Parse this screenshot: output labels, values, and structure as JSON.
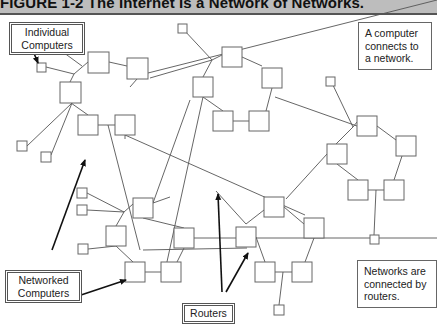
{
  "figure": {
    "title": "FIGURE 1-2   The Internet Is a Network of Networks."
  },
  "labels": {
    "individual_computers": [
      "Individual",
      "Computers"
    ],
    "networked_computers": [
      "Networked",
      "Computers"
    ],
    "routers": [
      "Routers"
    ],
    "note_top": [
      "A computer",
      "connects to",
      "a network."
    ],
    "note_bottom": [
      "Networks are",
      "connected by",
      "routers."
    ]
  },
  "colors": {
    "line": "#555555",
    "box_stroke": "#666666",
    "arrow": "#111111",
    "title_bg": "#bdbdbd"
  },
  "diagram": {
    "routers": [
      {
        "x": 88,
        "y": 52,
        "w": 21,
        "h": 21
      },
      {
        "x": 127,
        "y": 58,
        "w": 21,
        "h": 21
      },
      {
        "x": 60,
        "y": 82,
        "w": 21,
        "h": 21
      },
      {
        "x": 78,
        "y": 115,
        "w": 20,
        "h": 20
      },
      {
        "x": 115,
        "y": 115,
        "w": 20,
        "h": 20
      },
      {
        "x": 222,
        "y": 47,
        "w": 20,
        "h": 20
      },
      {
        "x": 262,
        "y": 68,
        "w": 20,
        "h": 20
      },
      {
        "x": 193,
        "y": 77,
        "w": 20,
        "h": 20
      },
      {
        "x": 213,
        "y": 111,
        "w": 20,
        "h": 20
      },
      {
        "x": 249,
        "y": 111,
        "w": 20,
        "h": 20
      },
      {
        "x": 357,
        "y": 116,
        "w": 20,
        "h": 20
      },
      {
        "x": 396,
        "y": 136,
        "w": 20,
        "h": 20
      },
      {
        "x": 327,
        "y": 144,
        "w": 20,
        "h": 20
      },
      {
        "x": 348,
        "y": 180,
        "w": 20,
        "h": 20
      },
      {
        "x": 384,
        "y": 180,
        "w": 20,
        "h": 20
      },
      {
        "x": 133,
        "y": 198,
        "w": 20,
        "h": 20
      },
      {
        "x": 106,
        "y": 226,
        "w": 20,
        "h": 20
      },
      {
        "x": 174,
        "y": 228,
        "w": 20,
        "h": 20
      },
      {
        "x": 125,
        "y": 262,
        "w": 20,
        "h": 20
      },
      {
        "x": 161,
        "y": 262,
        "w": 20,
        "h": 20
      },
      {
        "x": 264,
        "y": 197,
        "w": 20,
        "h": 20
      },
      {
        "x": 236,
        "y": 227,
        "w": 20,
        "h": 20
      },
      {
        "x": 304,
        "y": 218,
        "w": 20,
        "h": 20
      },
      {
        "x": 255,
        "y": 262,
        "w": 20,
        "h": 20
      },
      {
        "x": 292,
        "y": 262,
        "w": 20,
        "h": 20
      }
    ],
    "computers": [
      {
        "x": 46,
        "y": 42,
        "w": 10,
        "h": 10
      },
      {
        "x": 37,
        "y": 63,
        "w": 9,
        "h": 9
      },
      {
        "x": 178,
        "y": 24,
        "w": 9,
        "h": 9
      },
      {
        "x": 326,
        "y": 77,
        "w": 9,
        "h": 9
      },
      {
        "x": 17,
        "y": 141,
        "w": 10,
        "h": 10
      },
      {
        "x": 41,
        "y": 152,
        "w": 10,
        "h": 10
      },
      {
        "x": 77,
        "y": 188,
        "w": 10,
        "h": 10
      },
      {
        "x": 77,
        "y": 205,
        "w": 10,
        "h": 10
      },
      {
        "x": 78,
        "y": 244,
        "w": 10,
        "h": 10
      },
      {
        "x": 370,
        "y": 235,
        "w": 9,
        "h": 9
      },
      {
        "x": 274,
        "y": 305,
        "w": 10,
        "h": 10
      }
    ],
    "lines": [
      [
        56,
        47,
        82,
        66
      ],
      [
        46,
        67,
        74,
        74
      ],
      [
        74,
        74,
        88,
        62
      ],
      [
        74,
        74,
        70,
        82
      ],
      [
        109,
        62,
        127,
        66
      ],
      [
        137,
        79,
        130,
        87
      ],
      [
        148,
        73,
        437,
        0
      ],
      [
        71,
        103,
        88,
        115
      ],
      [
        98,
        125,
        115,
        125
      ],
      [
        72,
        103,
        27,
        146
      ],
      [
        72,
        103,
        51,
        155
      ],
      [
        125,
        135,
        125,
        139
      ],
      [
        125,
        135,
        305,
        215
      ],
      [
        108,
        125,
        140,
        250
      ],
      [
        183,
        29,
        212,
        60
      ],
      [
        212,
        60,
        222,
        55
      ],
      [
        212,
        60,
        203,
        77
      ],
      [
        212,
        60,
        150,
        78
      ],
      [
        242,
        57,
        262,
        66
      ],
      [
        272,
        88,
        266,
        111
      ],
      [
        233,
        121,
        249,
        121
      ],
      [
        203,
        97,
        223,
        111
      ],
      [
        203,
        97,
        163,
        280
      ],
      [
        275,
        97,
        357,
        126
      ],
      [
        331,
        81,
        353,
        127
      ],
      [
        353,
        127,
        357,
        122
      ],
      [
        353,
        127,
        336,
        144
      ],
      [
        377,
        126,
        396,
        140
      ],
      [
        337,
        164,
        358,
        180
      ],
      [
        368,
        190,
        384,
        190
      ],
      [
        376,
        190,
        374,
        235
      ],
      [
        402,
        156,
        394,
        180
      ],
      [
        327,
        154,
        286,
        199
      ],
      [
        153,
        203,
        170,
        197
      ],
      [
        153,
        203,
        190,
        100
      ],
      [
        87,
        193,
        124,
        212
      ],
      [
        87,
        210,
        124,
        212
      ],
      [
        124,
        212,
        133,
        204
      ],
      [
        124,
        212,
        116,
        226
      ],
      [
        88,
        249,
        116,
        246
      ],
      [
        116,
        246,
        133,
        262
      ],
      [
        143,
        218,
        184,
        228
      ],
      [
        184,
        248,
        177,
        262
      ],
      [
        145,
        272,
        161,
        272
      ],
      [
        194,
        238,
        437,
        238
      ],
      [
        284,
        207,
        304,
        224
      ],
      [
        314,
        238,
        305,
        262
      ],
      [
        256,
        237,
        265,
        262
      ],
      [
        275,
        272,
        292,
        272
      ],
      [
        283,
        272,
        279,
        305
      ],
      [
        216,
        191,
        246,
        224
      ],
      [
        246,
        224,
        264,
        210
      ],
      [
        143,
        250,
        247,
        248
      ]
    ],
    "arrows": [
      [
        31,
        46,
        46,
        47
      ],
      [
        31,
        46,
        38,
        63
      ],
      [
        52,
        250,
        85,
        160
      ],
      [
        78,
        296,
        126,
        280
      ],
      [
        222,
        292,
        218,
        194
      ],
      [
        226,
        292,
        248,
        253
      ]
    ]
  }
}
